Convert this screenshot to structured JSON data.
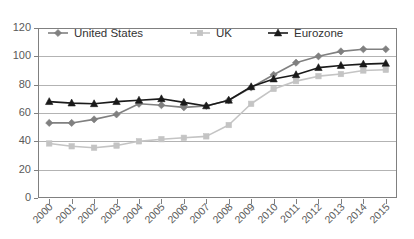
{
  "chart_data": {
    "type": "line",
    "title": "",
    "xlabel": "",
    "ylabel": "",
    "ylim": [
      0,
      120
    ],
    "ytick_step": 20,
    "yticks": [
      "0",
      "20",
      "40",
      "60",
      "80",
      "100",
      "120"
    ],
    "grid": true,
    "legend_position": "top-inside",
    "categories": [
      "2000",
      "2001",
      "2002",
      "2003",
      "2004",
      "2005",
      "2006",
      "2007",
      "2008",
      "2009",
      "2010",
      "2011",
      "2012",
      "2013",
      "2014",
      "2015"
    ],
    "series": [
      {
        "name": "United States",
        "color": "#808080",
        "marker": "diamond",
        "values": [
          53,
          53,
          55.5,
          59,
          66.5,
          65.5,
          64,
          65,
          69,
          78,
          87,
          95.5,
          100,
          103.5,
          105,
          105
        ]
      },
      {
        "name": "UK",
        "color": "#c4c4c4",
        "marker": "square",
        "values": [
          38.5,
          36.5,
          35.5,
          37,
          40,
          41.5,
          42.5,
          43.5,
          51.5,
          66.5,
          77,
          82.5,
          86,
          87.5,
          90,
          90.5
        ]
      },
      {
        "name": "Eurozone",
        "color": "#1a1a1a",
        "marker": "triangle",
        "values": [
          68,
          67,
          66.5,
          68,
          69,
          70,
          67.5,
          65,
          69,
          78.5,
          84,
          87,
          92,
          93.5,
          94.5,
          95
        ]
      }
    ]
  },
  "legend": {
    "items": [
      {
        "label": "United States"
      },
      {
        "label": "UK"
      },
      {
        "label": "Eurozone"
      }
    ]
  },
  "colors": {
    "united_states": "#808080",
    "uk": "#c4c4c4",
    "eurozone": "#1a1a1a",
    "gridline": "#b3b3b3",
    "axis": "#808080",
    "tick_text": "#5a5a5a",
    "legend_text": "#333333",
    "background": "#ffffff"
  }
}
